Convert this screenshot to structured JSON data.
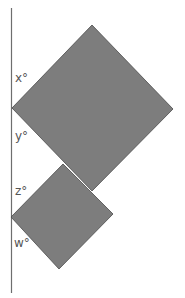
{
  "diagram": {
    "line": {
      "x1": 11.5,
      "y1": 8,
      "x2": 11.5,
      "y2": 293,
      "color": "#6e6e6e"
    },
    "fill_color": "#7d7d7d",
    "edge_color": "#4a4a4a",
    "squares": [
      {
        "name": "large-square",
        "points": "92,25 173,109 92,191 12,108"
      },
      {
        "name": "small-square",
        "points": "63,164 113,214 59,269 11,217"
      }
    ],
    "labels": [
      {
        "name": "angle-x",
        "text": "x°",
        "x": 15,
        "y": 82
      },
      {
        "name": "angle-y",
        "text": "y°",
        "x": 15,
        "y": 140
      },
      {
        "name": "angle-z",
        "text": "z°",
        "x": 15,
        "y": 195
      },
      {
        "name": "angle-w",
        "text": "w°",
        "x": 14,
        "y": 247
      }
    ]
  }
}
